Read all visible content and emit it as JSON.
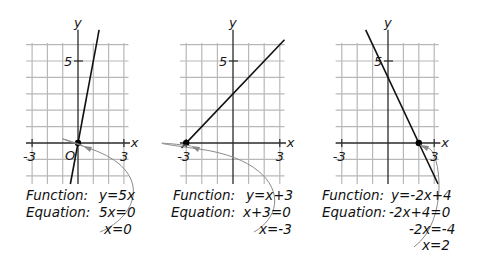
{
  "colors": {
    "grid": "#b8b8b8",
    "axis": "#2a2a2a",
    "line": "#111111",
    "point": "#000000",
    "arrow": "#8a8a8a",
    "text": "#111111"
  },
  "panels": [
    {
      "id": "panel-1",
      "axis_labels": {
        "x": "x",
        "y": "y"
      },
      "tick_labels": {
        "x_min": "-3",
        "x_max": "3",
        "y_five": "5",
        "origin": "O"
      },
      "function": {
        "slope": 5,
        "intercept": 0
      },
      "zero_point": {
        "x": 0,
        "y": 0
      },
      "text_lines": [
        {
          "label": "Function:",
          "value": "y=5x"
        },
        {
          "label": "Equation:",
          "value": "5x=0"
        },
        {
          "label": "",
          "value": "x=0"
        }
      ]
    },
    {
      "id": "panel-2",
      "axis_labels": {
        "x": "x",
        "y": "y"
      },
      "tick_labels": {
        "x_min": "-3",
        "x_max": "3",
        "y_five": "5",
        "origin": ""
      },
      "function": {
        "slope": 1,
        "intercept": 3
      },
      "zero_point": {
        "x": -3,
        "y": 0
      },
      "text_lines": [
        {
          "label": "Function:",
          "value": "y=x+3"
        },
        {
          "label": "Equation:",
          "value": "x+3=0"
        },
        {
          "label": "",
          "value": "x=-3"
        }
      ]
    },
    {
      "id": "panel-3",
      "axis_labels": {
        "x": "x",
        "y": "y"
      },
      "tick_labels": {
        "x_min": "-3",
        "x_max": "3",
        "y_five": "5",
        "origin": ""
      },
      "function": {
        "slope": -2,
        "intercept": 4
      },
      "zero_point": {
        "x": 2,
        "y": 0
      },
      "text_lines": [
        {
          "label": "Function:",
          "value": "y=-2x+4"
        },
        {
          "label": "Equation:",
          "value": "-2x+4=0"
        },
        {
          "label": "",
          "value": "-2x=-4"
        },
        {
          "label": "",
          "value": "x=2"
        }
      ]
    }
  ]
}
